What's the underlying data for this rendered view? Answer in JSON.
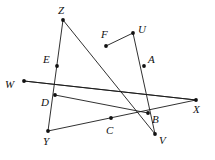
{
  "figure": {
    "width": 215,
    "height": 160,
    "background_color": "#ffffff",
    "line_color": "#1a1a1a",
    "vertex_color": "#111111",
    "label_color": "#111111",
    "label_style": "serif-italic",
    "points": [
      {
        "id": "Z",
        "label": "Z",
        "x": 63,
        "y": 20,
        "label_x": 58,
        "label_y": 5,
        "dot": true
      },
      {
        "id": "U",
        "label": "U",
        "x": 133,
        "y": 33,
        "label_x": 138,
        "label_y": 24,
        "dot": true
      },
      {
        "id": "F",
        "label": "F",
        "x": 106,
        "y": 46,
        "label_x": 101,
        "label_y": 29,
        "dot": true
      },
      {
        "id": "E",
        "label": "E",
        "x": 57,
        "y": 66,
        "label_x": 43,
        "label_y": 54,
        "dot": true
      },
      {
        "id": "A",
        "label": "A",
        "x": 144,
        "y": 66,
        "label_x": 148,
        "label_y": 54,
        "dot": true
      },
      {
        "id": "W",
        "label": "W",
        "x": 24,
        "y": 81,
        "label_x": 5,
        "label_y": 79,
        "dot": true
      },
      {
        "id": "D",
        "label": "D",
        "x": 55,
        "y": 95,
        "label_x": 41,
        "label_y": 97,
        "dot": true
      },
      {
        "id": "B",
        "label": "B",
        "x": 148,
        "y": 113,
        "label_x": 152,
        "label_y": 114,
        "dot": true
      },
      {
        "id": "C",
        "label": "C",
        "x": 111,
        "y": 118,
        "label_x": 106,
        "label_y": 125,
        "dot": true
      },
      {
        "id": "X",
        "label": "X",
        "x": 196,
        "y": 100,
        "label_x": 193,
        "label_y": 104,
        "dot": true
      },
      {
        "id": "Y",
        "label": "Y",
        "x": 48,
        "y": 131,
        "label_x": 43,
        "label_y": 136,
        "dot": true
      },
      {
        "id": "V",
        "label": "V",
        "x": 155,
        "y": 134,
        "label_x": 159,
        "label_y": 135,
        "dot": true
      }
    ],
    "segments": [
      {
        "name": "Z-Y",
        "from": "Z",
        "to": "Y",
        "through": [
          "E",
          "D"
        ]
      },
      {
        "name": "Z-V",
        "from": "Z",
        "to": "V",
        "through": [
          "F",
          "B"
        ]
      },
      {
        "name": "U-F",
        "from": "U",
        "to": "F",
        "through": []
      },
      {
        "name": "U-V",
        "from": "U",
        "to": "V",
        "through": [
          "A",
          "B"
        ]
      },
      {
        "name": "W-X",
        "from": "W",
        "to": "X",
        "through": [
          "E",
          "F",
          "A"
        ]
      },
      {
        "name": "W-X-lower",
        "from": "W",
        "to": "X",
        "through": [
          "D",
          "C"
        ]
      },
      {
        "name": "Y-X",
        "from": "Y",
        "to": "X",
        "through": [
          "C"
        ]
      },
      {
        "name": "D-B",
        "from": "D",
        "to": "B",
        "through": [
          "C"
        ]
      }
    ]
  }
}
